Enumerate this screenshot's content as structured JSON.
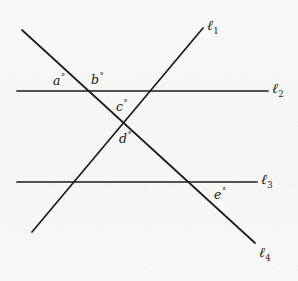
{
  "figure": {
    "type": "geometry-line-diagram",
    "background_color": "#f7f7f6",
    "stroke_color": "#1b1b1e",
    "canvas": {
      "width": 298,
      "height": 281
    }
  },
  "lines": [
    {
      "id": "l1",
      "name": "line-l1",
      "label": "ℓ",
      "subscript": "1",
      "orientation": "oblique-rising",
      "x1": 32,
      "y1": 232,
      "x2": 203,
      "y2": 28,
      "label_x": 207,
      "label_y": 18,
      "stroke_width": 1.7
    },
    {
      "id": "l2",
      "name": "line-l2",
      "label": "ℓ",
      "subscript": "2",
      "orientation": "horizontal",
      "x1": 17,
      "y1": 91,
      "x2": 268,
      "y2": 91,
      "label_x": 272,
      "label_y": 81,
      "stroke_width": 1.7
    },
    {
      "id": "l3",
      "name": "line-l3",
      "label": "ℓ",
      "subscript": "3",
      "orientation": "horizontal",
      "x1": 17,
      "y1": 182,
      "x2": 257,
      "y2": 182,
      "label_x": 261,
      "label_y": 172,
      "stroke_width": 1.7
    },
    {
      "id": "l4",
      "name": "line-l4",
      "label": "ℓ",
      "subscript": "4",
      "orientation": "oblique-falling",
      "x1": 22,
      "y1": 30,
      "x2": 255,
      "y2": 243,
      "label_x": 259,
      "label_y": 245,
      "stroke_width": 1.7
    }
  ],
  "angles": [
    {
      "id": "a",
      "name": "angle-a",
      "label": "a",
      "degree_symbol": "°",
      "x": 53,
      "y": 73,
      "location": "above l2, left of l4 intersection"
    },
    {
      "id": "b",
      "name": "angle-b",
      "label": "b",
      "degree_symbol": "°",
      "x": 91,
      "y": 72,
      "location": "above l2, right of l4 intersection"
    },
    {
      "id": "c",
      "name": "angle-c",
      "label": "c",
      "degree_symbol": "°",
      "x": 116,
      "y": 99,
      "location": "above X intersection of l1 and l4"
    },
    {
      "id": "d",
      "name": "angle-d",
      "label": "d",
      "degree_symbol": "°",
      "x": 119,
      "y": 131,
      "location": "below X intersection of l1 and l4"
    },
    {
      "id": "e",
      "name": "angle-e",
      "label": "e",
      "degree_symbol": "°",
      "x": 214,
      "y": 187,
      "location": "below l3, right of l4 intersection"
    }
  ],
  "intersections": [
    {
      "name": "l4-crosses-l2",
      "x": 78,
      "y": 91
    },
    {
      "name": "l1-crosses-l2",
      "x": 152,
      "y": 91
    },
    {
      "name": "l1-crosses-l4",
      "x": 124,
      "y": 122
    },
    {
      "name": "l1-crosses-l3",
      "x": 76,
      "y": 182
    },
    {
      "name": "l4-crosses-l3",
      "x": 198,
      "y": 182
    }
  ]
}
